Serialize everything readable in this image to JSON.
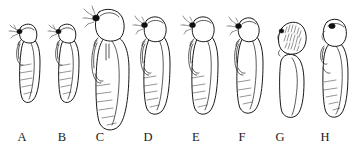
{
  "figure": {
    "kind": "scientific-line-drawing-plate",
    "background_color": "#ffffff",
    "ink_color": "#0d0d0d",
    "panel_count": 8
  },
  "labels": [
    {
      "text": "A",
      "x": 22
    },
    {
      "text": "B",
      "x": 62
    },
    {
      "text": "C",
      "x": 100
    },
    {
      "text": "D",
      "x": 148
    },
    {
      "text": "E",
      "x": 196
    },
    {
      "text": "F",
      "x": 242
    },
    {
      "text": "G",
      "x": 280
    },
    {
      "text": "H",
      "x": 325
    }
  ],
  "specimens": [
    {
      "label": "A",
      "head_type": "appendaged",
      "has_dark_eye": true,
      "has_antennal_processes": true,
      "head_texture": "smooth",
      "abdomen_segments": 6,
      "relative_size": "small"
    },
    {
      "label": "B",
      "head_type": "appendaged",
      "has_dark_eye": true,
      "has_antennal_processes": true,
      "head_texture": "smooth",
      "abdomen_segments": 6,
      "relative_size": "small"
    },
    {
      "label": "C",
      "head_type": "appendaged",
      "has_dark_eye": true,
      "has_antennal_processes": true,
      "head_texture": "smooth",
      "abdomen_segments": 7,
      "relative_size": "largest"
    },
    {
      "label": "D",
      "head_type": "appendaged",
      "has_dark_eye": true,
      "has_antennal_processes": true,
      "head_texture": "smooth",
      "abdomen_segments": 6,
      "relative_size": "medium"
    },
    {
      "label": "E",
      "head_type": "appendaged",
      "has_dark_eye": true,
      "has_antennal_processes": true,
      "head_texture": "smooth",
      "abdomen_segments": 6,
      "relative_size": "medium"
    },
    {
      "label": "F",
      "head_type": "appendaged",
      "has_dark_eye": true,
      "has_antennal_processes": true,
      "head_texture": "smooth",
      "abdomen_segments": 5,
      "relative_size": "medium"
    },
    {
      "label": "G",
      "head_type": "rounded-capsule",
      "has_dark_eye": true,
      "has_antennal_processes": false,
      "head_texture": "stippled",
      "abdomen_segments": 0,
      "relative_size": "medium"
    },
    {
      "label": "H",
      "head_type": "rounded-capsule",
      "has_dark_eye": true,
      "has_antennal_processes": false,
      "head_texture": "smooth",
      "abdomen_segments": 5,
      "relative_size": "medium"
    }
  ]
}
